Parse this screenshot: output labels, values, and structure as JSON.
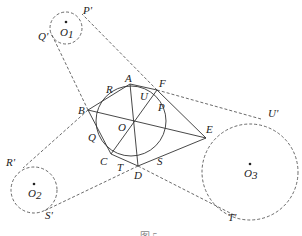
{
  "figure": {
    "caption": "图 5",
    "stroke_color": "#333333",
    "background": "#ffffff"
  },
  "main_circle": {
    "label": "O",
    "cx": 131,
    "cy": 121,
    "r": 35
  },
  "hexagon_vertices": [
    {
      "label": "A",
      "x": 130,
      "y": 84
    },
    {
      "label": "F",
      "x": 157,
      "y": 90
    },
    {
      "label": "E",
      "x": 206,
      "y": 138
    },
    {
      "label": "D",
      "x": 138,
      "y": 166
    },
    {
      "label": "C",
      "x": 111,
      "y": 154
    },
    {
      "label": "B",
      "x": 88,
      "y": 110
    }
  ],
  "tangent_points": [
    {
      "label": "R",
      "x": 110,
      "y": 92
    },
    {
      "label": "U",
      "x": 146,
      "y": 97
    },
    {
      "label": "P",
      "x": 155,
      "y": 107
    },
    {
      "label": "Q",
      "x": 96,
      "y": 136
    },
    {
      "label": "T",
      "x": 124,
      "y": 163
    },
    {
      "label": "S",
      "x": 158,
      "y": 156
    }
  ],
  "diagonals": [
    "AD",
    "BE",
    "CF"
  ],
  "outer_circles": [
    {
      "label": "O1",
      "cx": 66,
      "cy": 28,
      "r": 16,
      "tangent_labels": [
        "P'",
        "Q'"
      ]
    },
    {
      "label": "O2",
      "cx": 34,
      "cy": 190,
      "r": 23,
      "tangent_labels": [
        "R'",
        "S'"
      ]
    },
    {
      "label": "O3",
      "cx": 250,
      "cy": 172,
      "r": 48,
      "tangent_labels": [
        "U'",
        "T'"
      ]
    }
  ],
  "labels": {
    "A": "A",
    "B": "B",
    "C": "C",
    "D": "D",
    "E": "E",
    "F": "F",
    "O": "O",
    "P": "P",
    "Q": "Q",
    "R": "R",
    "S": "S",
    "T": "T",
    "U": "U",
    "P_prime": "P'",
    "Q_prime": "Q'",
    "R_prime": "R'",
    "S_prime": "S'",
    "T_prime": "T'",
    "U_prime": "U'",
    "O1_main": "O",
    "O1_sub": "1",
    "O2_main": "O",
    "O2_sub": "2",
    "O3_main": "O",
    "O3_sub": "3"
  }
}
